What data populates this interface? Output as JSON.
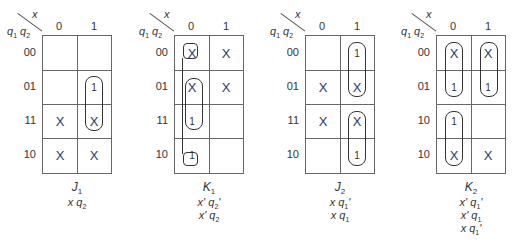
{
  "axis": {
    "col_var": "x",
    "row_var_1": "q",
    "row_var_1_sub": "1",
    "row_var_2": "q",
    "row_var_2_sub": "2",
    "col_headers": [
      "0",
      "1"
    ]
  },
  "maps": [
    {
      "name": "J",
      "sub": "1",
      "row_headers": [
        "00",
        "01",
        "11",
        "10"
      ],
      "cells": [
        [
          "",
          ""
        ],
        [
          "",
          "1"
        ],
        [
          "X",
          "X"
        ],
        [
          "X",
          "X"
        ]
      ],
      "terms": [
        "x q2"
      ]
    },
    {
      "name": "K",
      "sub": "1",
      "row_headers": [
        "00",
        "01",
        "11",
        "10"
      ],
      "cells": [
        [
          "X",
          "X"
        ],
        [
          "X",
          "X"
        ],
        [
          "1",
          ""
        ],
        [
          "1",
          ""
        ]
      ],
      "terms": [
        "x' q2'",
        "x' q2"
      ]
    },
    {
      "name": "J",
      "sub": "2",
      "row_headers": [
        "00",
        "01",
        "11",
        "10"
      ],
      "cells": [
        [
          "",
          "1"
        ],
        [
          "X",
          "X"
        ],
        [
          "X",
          "X"
        ],
        [
          "",
          "1"
        ]
      ],
      "terms": [
        "x q1'",
        "x q1"
      ]
    },
    {
      "name": "K",
      "sub": "2",
      "row_headers": [
        "00",
        "01",
        "10",
        "10"
      ],
      "cells": [
        [
          "X",
          "X"
        ],
        [
          "1",
          "1"
        ],
        [
          "1",
          ""
        ],
        [
          "X",
          "X"
        ]
      ],
      "terms": [
        "x' q1'",
        "x' q1",
        "x q1'"
      ]
    }
  ],
  "term_parts": {
    "m0": [
      {
        "a": "x",
        "b": "q",
        "s": "2",
        "p": ""
      }
    ],
    "m1": [
      {
        "a": "x'",
        "b": "q",
        "s": "2",
        "p": "'"
      },
      {
        "a": "x'",
        "b": "q",
        "s": "2",
        "p": ""
      }
    ],
    "m2": [
      {
        "a": "x",
        "b": "q",
        "s": "1",
        "p": "'"
      },
      {
        "a": "x",
        "b": "q",
        "s": "1",
        "p": ""
      }
    ],
    "m3": [
      {
        "a": "x'",
        "b": "q",
        "s": "1",
        "p": "'"
      },
      {
        "a": "x'",
        "b": "q",
        "s": "1",
        "p": ""
      },
      {
        "a": "x",
        "b": "q",
        "s": "1",
        "p": "'"
      }
    ]
  }
}
